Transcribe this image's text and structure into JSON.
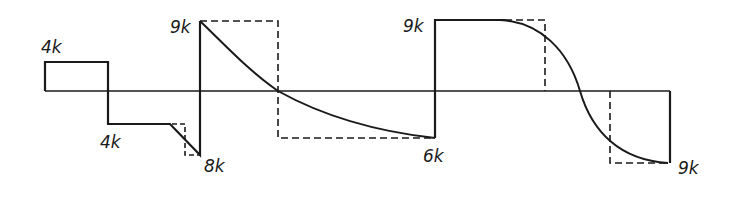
{
  "diagram": {
    "type": "shear/load waveform diagram",
    "colors": {
      "line": "#1a1a1a",
      "background": "#ffffff"
    },
    "labels": {
      "first_positive": "4k",
      "first_negative": "4k",
      "low_point": "8k",
      "peak_1": "9k",
      "trough_1": "6k",
      "peak_2": "9k",
      "trough_2": "9k"
    }
  }
}
